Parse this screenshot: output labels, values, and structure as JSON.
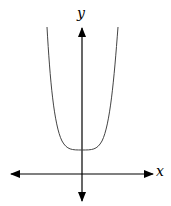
{
  "diagram": {
    "type": "function-graph",
    "axes": {
      "x_label": "x",
      "y_label": "y"
    },
    "curve": {
      "shape": "flat-bottomed U",
      "vertex": "on y-axis, above x-axis",
      "color": "#444444"
    },
    "colors": {
      "axis": "#000000",
      "curve": "#444444",
      "background": "#ffffff"
    }
  }
}
